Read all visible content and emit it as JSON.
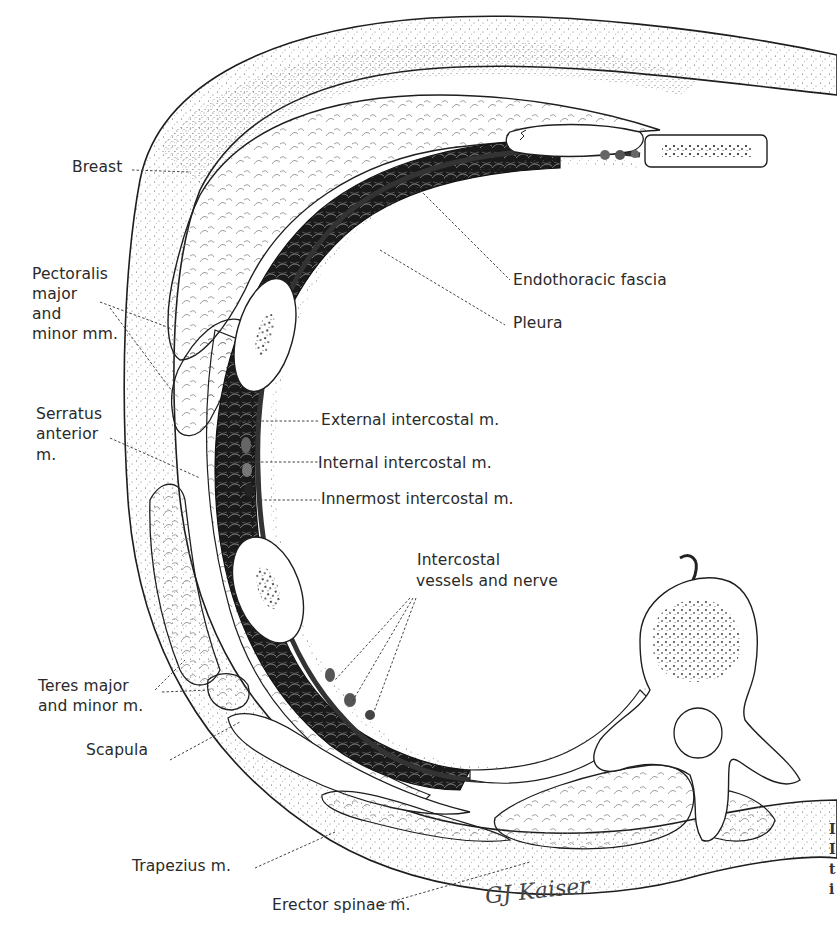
{
  "figure": {
    "type": "anatomical cross-section illustration",
    "signature": "GJ Kaiser",
    "colors": {
      "ink": "#1e1e1e",
      "label_text": "#2a2a2a",
      "leader_line": "#444444",
      "muscle_dark": "#1a1a1a",
      "background": "#ffffff"
    }
  },
  "labels": {
    "breast": "Breast",
    "pectoralis": [
      "Pectoralis",
      "major",
      "and",
      "minor mm."
    ],
    "endothoracic_fascia": "Endothoracic fascia",
    "pleura": "Pleura",
    "serratus": [
      "Serratus",
      "anterior",
      "m."
    ],
    "external_intercostal": "External intercostal m.",
    "internal_intercostal": "Internal intercostal m.",
    "innermost_intercostal": "Innermost intercostal m.",
    "intercostal_vessels": [
      "Intercostal",
      "vessels and nerve"
    ],
    "teres": [
      "Teres major",
      "and minor m."
    ],
    "scapula": "Scapula",
    "trapezius": "Trapezius m.",
    "erector_spinae": "Erector spinae m."
  },
  "caption_fragment": [
    "I",
    "I",
    "t",
    "i"
  ]
}
